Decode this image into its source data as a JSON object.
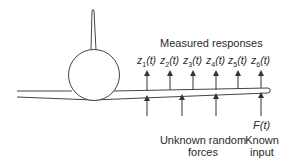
{
  "diagram": {
    "title": "Measured responses",
    "responses": [
      {
        "var": "z",
        "sub": "1",
        "arg": "(t)"
      },
      {
        "var": "z",
        "sub": "2",
        "arg": "(t)"
      },
      {
        "var": "z",
        "sub": "3",
        "arg": "(t)"
      },
      {
        "var": "z",
        "sub": "4",
        "arg": "(t)"
      },
      {
        "var": "z",
        "sub": "5",
        "arg": "(t)"
      },
      {
        "var": "z",
        "sub": "6",
        "arg": "(t)"
      }
    ],
    "known_force_symbol": "F(t)",
    "unknown_forces_label_line1": "Unknown random",
    "unknown_forces_label_line2": "forces",
    "known_input_label_line1": "Known",
    "known_input_label_line2": "input",
    "line_color": "#333333"
  }
}
